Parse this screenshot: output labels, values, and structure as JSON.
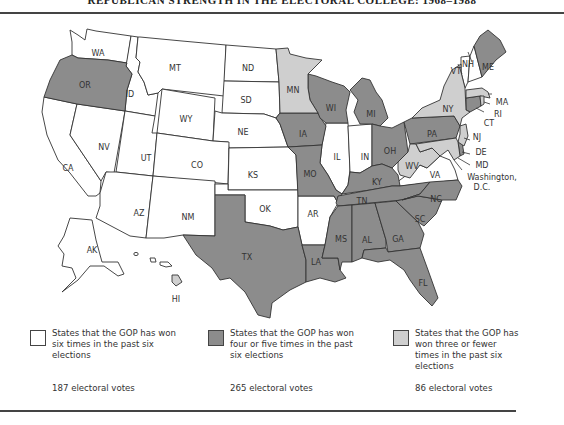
{
  "header": {
    "title": "REPUBLICAN STRENGTH IN THE ELECTORAL COLLEGE: 1968–1988"
  },
  "colors": {
    "six_wins": "#ffffff",
    "four_five_wins": "#8c8c8c",
    "three_or_fewer": "#cfcfcf",
    "border": "#333333"
  },
  "map": {
    "labels": {
      "WA": "WA",
      "OR": "OR",
      "CA": "CA",
      "ID": "ID",
      "NV": "NV",
      "MT": "MT",
      "WY": "WY",
      "UT": "UT",
      "CO": "CO",
      "AZ": "AZ",
      "NM": "NM",
      "ND": "ND",
      "SD": "SD",
      "NE": "NE",
      "KS": "KS",
      "OK": "OK",
      "TX": "TX",
      "MN": "MN",
      "IA": "IA",
      "MO": "MO",
      "AR": "AR",
      "LA": "LA",
      "WI": "WI",
      "IL": "IL",
      "MI": "MI",
      "IN": "IN",
      "OH": "OH",
      "KY": "KY",
      "TN": "TN",
      "MS": "MS",
      "AL": "AL",
      "GA": "GA",
      "FL": "FL",
      "SC": "SC",
      "NC": "NC",
      "VA": "VA",
      "WV": "WV",
      "PA": "PA",
      "NY": "NY",
      "VT": "VT",
      "NH": "NH",
      "ME": "ME",
      "MA": "MA",
      "RI": "RI",
      "CT": "CT",
      "NJ": "NJ",
      "DE": "DE",
      "MD": "MD",
      "AK": "AK",
      "HI": "HI",
      "DC_line1": "Washington,",
      "DC_line2": "D.C."
    },
    "states_by_category": {
      "six_wins": [
        "WA",
        "CA",
        "ID",
        "NV",
        "MT",
        "WY",
        "UT",
        "CO",
        "AZ",
        "NM",
        "ND",
        "SD",
        "NE",
        "KS",
        "OK",
        "AR",
        "IL",
        "IN",
        "VA",
        "VT",
        "NH",
        "AK"
      ],
      "four_five_wins": [
        "OR",
        "TX",
        "IA",
        "MO",
        "LA",
        "WI",
        "MI",
        "OH",
        "KY",
        "TN",
        "MS",
        "AL",
        "GA",
        "FL",
        "SC",
        "NC",
        "PA",
        "ME",
        "CT",
        "DE"
      ],
      "three_or_fewer": [
        "MN",
        "WV",
        "NY",
        "MA",
        "RI",
        "NJ",
        "MD",
        "HI"
      ]
    }
  },
  "legend": [
    {
      "text": "States that the GOP has won six times in the past six elections",
      "votes": "187 electoral votes"
    },
    {
      "text": "States that the GOP has won four or five times in the past six elections",
      "votes": "265 electoral votes"
    },
    {
      "text": "States that the GOP has won three or fewer times in the past six elections",
      "votes": "86 electoral votes"
    }
  ]
}
